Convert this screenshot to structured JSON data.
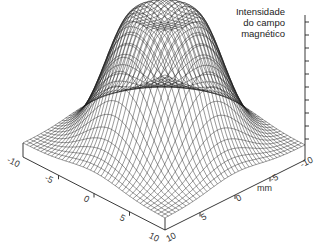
{
  "chart_data": {
    "type": "surface3d",
    "title": "",
    "zlabel": "Intensidade do campo magnético",
    "zlabel_lines": [
      "Intensidade",
      "do campo",
      "magnético"
    ],
    "unit_label": "mm",
    "x_axis": {
      "label": "",
      "ticks": [
        "-10",
        "-5",
        "0",
        "5",
        "10"
      ],
      "range": [
        -10,
        10
      ]
    },
    "y_axis": {
      "label": "mm",
      "ticks": [
        "-10",
        "-5",
        "0",
        "5",
        "10"
      ],
      "range": [
        -10,
        10
      ]
    },
    "z_axis": {
      "ticks_count": 10,
      "labels_visible": false
    },
    "surface": {
      "shape": "flat-topped gaussian plateau with rim",
      "center": [
        0,
        0
      ],
      "peak_radius_mm": 3,
      "falloff_sigma_mm": 3,
      "mesh_resolution": 40,
      "mesh_color": "#1a1a1a",
      "grid": false
    }
  }
}
